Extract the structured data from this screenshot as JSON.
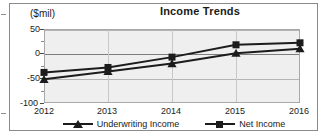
{
  "chart_data": {
    "type": "line",
    "title": "Income Trends",
    "xlabel": "",
    "ylabel": "($mil)",
    "ylim": [
      -100,
      50
    ],
    "yticks": [
      50,
      0,
      -50,
      -100
    ],
    "ytick_labels": [
      "50",
      "0",
      "-50",
      "-100"
    ],
    "grid": true,
    "legend_position": "bottom",
    "categories": [
      "2012",
      "2013",
      "2014",
      "2015",
      "2016"
    ],
    "series": [
      {
        "name": "Underwriting Income",
        "marker": "triangle",
        "color": "#1c1c1c",
        "values": [
          -52,
          -36,
          -20,
          1,
          10
        ]
      },
      {
        "name": "Net Income",
        "marker": "square",
        "color": "#1c1c1c",
        "values": [
          -38,
          -28,
          -7,
          18,
          22
        ]
      }
    ]
  },
  "axis": {
    "unit_label": "($mil)",
    "y_tick_0": "50",
    "y_tick_1": "0",
    "y_tick_2": "-50",
    "y_tick_3": "-100",
    "x_tick_0": "2012",
    "x_tick_1": "2013",
    "x_tick_2": "2014",
    "x_tick_3": "2015",
    "x_tick_4": "2016"
  },
  "legend": {
    "entry_0": "Underwriting Income",
    "entry_1": "Net Income"
  }
}
